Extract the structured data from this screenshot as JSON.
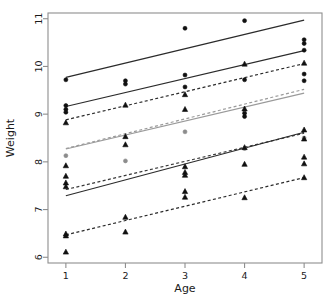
{
  "chart_data": {
    "type": "scatter",
    "title": "",
    "xlabel": "Age",
    "ylabel": "Weight",
    "xlim": [
      0.7,
      5.3
    ],
    "ylim": [
      5.88,
      11.12
    ],
    "xticks": [
      1,
      2,
      3,
      4,
      5
    ],
    "xtick_labels": [
      "1",
      "2",
      "3",
      "4",
      "5"
    ],
    "yticks": [
      6,
      7,
      8,
      9,
      10,
      11
    ],
    "ytick_labels": [
      "6",
      "7",
      "8",
      "9",
      "10",
      "11"
    ],
    "grid": false,
    "legend": "none",
    "frame": true,
    "marker_shapes": [
      "circle",
      "triangle"
    ],
    "series": [
      {
        "name": "group-1-circle-solid-dark",
        "marker": "circle",
        "color": "#101010",
        "points": [
          {
            "x": 1,
            "y": 9.72
          },
          {
            "x": 2,
            "y": 9.7
          },
          {
            "x": 2,
            "y": 9.63
          },
          {
            "x": 3,
            "y": 10.8
          },
          {
            "x": 3,
            "y": 9.82
          },
          {
            "x": 4,
            "y": 10.96
          },
          {
            "x": 4,
            "y": 9.72
          },
          {
            "x": 5,
            "y": 10.56
          },
          {
            "x": 5,
            "y": 10.48
          },
          {
            "x": 5,
            "y": 10.34
          }
        ]
      },
      {
        "name": "group-2-circle-solid-dark",
        "marker": "circle",
        "color": "#101010",
        "points": [
          {
            "x": 1,
            "y": 9.18
          },
          {
            "x": 1,
            "y": 9.1
          },
          {
            "x": 1,
            "y": 9.04
          },
          {
            "x": 3,
            "y": 9.57
          },
          {
            "x": 4,
            "y": 9.02
          },
          {
            "x": 4,
            "y": 8.95
          },
          {
            "x": 5,
            "y": 9.84
          },
          {
            "x": 5,
            "y": 9.7
          }
        ]
      },
      {
        "name": "group-3-triangle-dashed-dark",
        "marker": "triangle",
        "color": "#101010",
        "points": [
          {
            "x": 1,
            "y": 8.82
          },
          {
            "x": 2,
            "y": 9.19
          },
          {
            "x": 3,
            "y": 9.41
          },
          {
            "x": 3,
            "y": 9.1
          },
          {
            "x": 4,
            "y": 10.05
          },
          {
            "x": 4,
            "y": 9.11
          },
          {
            "x": 5,
            "y": 10.07
          }
        ]
      },
      {
        "name": "group-4-gray-solid",
        "marker": "circle",
        "color": "#8c8c8c",
        "points": [
          {
            "x": 1,
            "y": 8.13
          },
          {
            "x": 2,
            "y": 8.02
          },
          {
            "x": 3,
            "y": 8.63
          },
          {
            "x": 4,
            "y": 8.28
          },
          {
            "x": 5,
            "y": 8.5
          }
        ]
      },
      {
        "name": "group-5-triangle-solid-dark",
        "marker": "triangle",
        "color": "#101010",
        "points": [
          {
            "x": 1,
            "y": 7.92
          },
          {
            "x": 1,
            "y": 7.7
          },
          {
            "x": 1,
            "y": 7.56
          },
          {
            "x": 1,
            "y": 7.48
          },
          {
            "x": 2,
            "y": 8.53
          },
          {
            "x": 2,
            "y": 8.36
          },
          {
            "x": 3,
            "y": 7.9
          },
          {
            "x": 3,
            "y": 7.78
          },
          {
            "x": 3,
            "y": 7.72
          },
          {
            "x": 4,
            "y": 8.3
          },
          {
            "x": 4,
            "y": 7.95
          },
          {
            "x": 5,
            "y": 8.67
          },
          {
            "x": 5,
            "y": 8.48
          },
          {
            "x": 5,
            "y": 8.1
          },
          {
            "x": 5,
            "y": 7.96
          }
        ]
      },
      {
        "name": "group-6-triangle-dashed-low",
        "marker": "triangle",
        "color": "#101010",
        "points": [
          {
            "x": 1,
            "y": 6.49
          },
          {
            "x": 1,
            "y": 6.45
          },
          {
            "x": 1,
            "y": 6.11
          },
          {
            "x": 2,
            "y": 6.84
          },
          {
            "x": 2,
            "y": 6.53
          },
          {
            "x": 3,
            "y": 7.38
          },
          {
            "x": 3,
            "y": 7.26
          },
          {
            "x": 4,
            "y": 7.25
          },
          {
            "x": 5,
            "y": 7.67
          }
        ]
      }
    ],
    "fit_lines": [
      {
        "name": "fit-line-1",
        "style": "solid",
        "color": "#2b2b2b",
        "width": 1.2,
        "x1": 1,
        "y1": 9.77,
        "x2": 5,
        "y2": 10.97
      },
      {
        "name": "fit-line-2",
        "style": "solid",
        "color": "#2b2b2b",
        "width": 1.2,
        "x1": 1,
        "y1": 9.16,
        "x2": 5,
        "y2": 10.33
      },
      {
        "name": "fit-line-3",
        "style": "dashed",
        "color": "#2b2b2b",
        "width": 1.2,
        "x1": 1,
        "y1": 8.88,
        "x2": 5,
        "y2": 10.06
      },
      {
        "name": "fit-line-4",
        "style": "dashed",
        "color": "#9a9a9a",
        "width": 1.2,
        "x1": 1,
        "y1": 8.28,
        "x2": 5,
        "y2": 9.52
      },
      {
        "name": "fit-line-5",
        "style": "solid",
        "color": "#9a9a9a",
        "width": 1.2,
        "x1": 1,
        "y1": 8.27,
        "x2": 5,
        "y2": 9.44
      },
      {
        "name": "fit-line-6",
        "style": "dashed",
        "color": "#3a3a3a",
        "width": 1.2,
        "x1": 1,
        "y1": 7.42,
        "x2": 5,
        "y2": 8.6
      },
      {
        "name": "fit-line-7",
        "style": "solid",
        "color": "#2b2b2b",
        "width": 1.2,
        "x1": 1,
        "y1": 7.29,
        "x2": 5,
        "y2": 8.62
      },
      {
        "name": "fit-line-8",
        "style": "dashed",
        "color": "#2b2b2b",
        "width": 1.2,
        "x1": 1,
        "y1": 6.47,
        "x2": 5,
        "y2": 7.67
      }
    ]
  }
}
